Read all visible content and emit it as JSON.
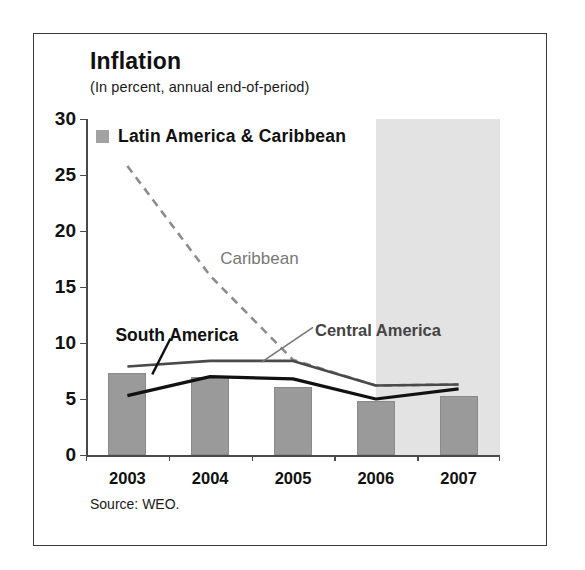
{
  "figure": {
    "title": "Inflation",
    "subtitle": "(In percent, annual end-of-period)",
    "source": "Source: WEO.",
    "legend": {
      "label": "Latin America & Caribbean",
      "swatch_color": "#a2a2a2"
    },
    "colors": {
      "bar": "#9a9a9a",
      "forecast_band": "#e3e3e3",
      "central_america_line": "#4a4a4a",
      "south_america_line": "#111111",
      "caribbean_line": "#8c8c8c",
      "axis": "#4a4a4a",
      "border": "#3a3a3a"
    }
  },
  "chart_data": {
    "type": "bar",
    "title": "Inflation",
    "subtitle": "(In percent, annual end-of-period)",
    "xlabel": "",
    "ylabel": "",
    "ylim": [
      0,
      30
    ],
    "yticks": [
      0,
      5,
      10,
      15,
      20,
      25,
      30
    ],
    "grid": false,
    "legend_position": "top-left",
    "categories": [
      "2003",
      "2004",
      "2005",
      "2006",
      "2007"
    ],
    "bars": {
      "name": "Latin America & Caribbean",
      "values": [
        7.3,
        7.0,
        6.1,
        4.8,
        5.3
      ],
      "style": "bar",
      "color": "#9a9a9a"
    },
    "series": [
      {
        "name": "Caribbean",
        "values": [
          25.8,
          16.0,
          8.5,
          6.2,
          6.3
        ],
        "style": "dashed-line",
        "color": "#8c8c8c"
      },
      {
        "name": "Central America",
        "values": [
          7.9,
          8.4,
          8.4,
          6.2,
          6.3
        ],
        "style": "solid-line",
        "color": "#4a4a4a"
      },
      {
        "name": "South America",
        "values": [
          5.3,
          7.0,
          6.8,
          5.0,
          5.9
        ],
        "style": "solid-line",
        "color": "#111111"
      }
    ],
    "annotations": [
      {
        "text": "Caribbean",
        "series": "Caribbean"
      },
      {
        "text": "Central America",
        "series": "Central America"
      },
      {
        "text": "South America",
        "series": "South America"
      }
    ],
    "forecast_band": {
      "from": "2006.5",
      "to": "2007.6",
      "label": ""
    }
  }
}
